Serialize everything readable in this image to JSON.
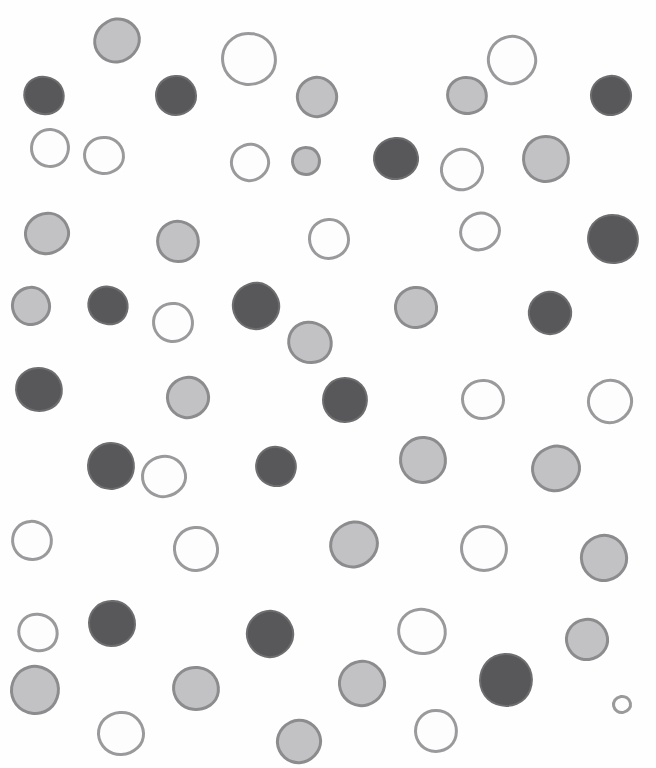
{
  "scene": {
    "description": "Hand-drawn watercolor circles pattern",
    "background": "#fefefe",
    "palette": {
      "dark": "#58585a",
      "light": "#c2c2c4",
      "outline": "#9a9a9c"
    },
    "circles": [
      {
        "x": 117,
        "y": 42,
        "d": 48,
        "t": "light"
      },
      {
        "x": 249,
        "y": 60,
        "d": 56,
        "t": "outline"
      },
      {
        "x": 512,
        "y": 60,
        "d": 50,
        "t": "outline"
      },
      {
        "x": 44,
        "y": 97,
        "d": 42,
        "t": "dark"
      },
      {
        "x": 176,
        "y": 96,
        "d": 42,
        "t": "dark"
      },
      {
        "x": 317,
        "y": 97,
        "d": 42,
        "t": "light"
      },
      {
        "x": 467,
        "y": 97,
        "d": 42,
        "t": "light"
      },
      {
        "x": 611,
        "y": 96,
        "d": 42,
        "t": "dark"
      },
      {
        "x": 50,
        "y": 148,
        "d": 40,
        "t": "outline"
      },
      {
        "x": 104,
        "y": 157,
        "d": 42,
        "t": "outline"
      },
      {
        "x": 250,
        "y": 163,
        "d": 40,
        "t": "outline"
      },
      {
        "x": 306,
        "y": 161,
        "d": 30,
        "t": "light"
      },
      {
        "x": 396,
        "y": 160,
        "d": 46,
        "t": "dark"
      },
      {
        "x": 462,
        "y": 170,
        "d": 44,
        "t": "outline"
      },
      {
        "x": 546,
        "y": 159,
        "d": 48,
        "t": "light"
      },
      {
        "x": 47,
        "y": 235,
        "d": 46,
        "t": "light"
      },
      {
        "x": 178,
        "y": 242,
        "d": 44,
        "t": "light"
      },
      {
        "x": 329,
        "y": 239,
        "d": 42,
        "t": "outline"
      },
      {
        "x": 480,
        "y": 233,
        "d": 42,
        "t": "outline"
      },
      {
        "x": 613,
        "y": 240,
        "d": 52,
        "t": "dark"
      },
      {
        "x": 31,
        "y": 306,
        "d": 40,
        "t": "light"
      },
      {
        "x": 108,
        "y": 307,
        "d": 42,
        "t": "dark"
      },
      {
        "x": 173,
        "y": 323,
        "d": 42,
        "t": "outline"
      },
      {
        "x": 256,
        "y": 306,
        "d": 48,
        "t": "dark"
      },
      {
        "x": 310,
        "y": 344,
        "d": 46,
        "t": "light"
      },
      {
        "x": 416,
        "y": 308,
        "d": 44,
        "t": "light"
      },
      {
        "x": 550,
        "y": 313,
        "d": 44,
        "t": "dark"
      },
      {
        "x": 39,
        "y": 391,
        "d": 48,
        "t": "dark"
      },
      {
        "x": 188,
        "y": 398,
        "d": 44,
        "t": "light"
      },
      {
        "x": 345,
        "y": 400,
        "d": 46,
        "t": "dark"
      },
      {
        "x": 483,
        "y": 401,
        "d": 44,
        "t": "outline"
      },
      {
        "x": 610,
        "y": 402,
        "d": 46,
        "t": "outline"
      },
      {
        "x": 111,
        "y": 466,
        "d": 48,
        "t": "dark"
      },
      {
        "x": 164,
        "y": 478,
        "d": 46,
        "t": "outline"
      },
      {
        "x": 276,
        "y": 467,
        "d": 42,
        "t": "dark"
      },
      {
        "x": 423,
        "y": 460,
        "d": 48,
        "t": "light"
      },
      {
        "x": 556,
        "y": 470,
        "d": 50,
        "t": "light"
      },
      {
        "x": 32,
        "y": 541,
        "d": 42,
        "t": "outline"
      },
      {
        "x": 196,
        "y": 549,
        "d": 46,
        "t": "outline"
      },
      {
        "x": 354,
        "y": 546,
        "d": 50,
        "t": "light"
      },
      {
        "x": 484,
        "y": 549,
        "d": 48,
        "t": "outline"
      },
      {
        "x": 604,
        "y": 558,
        "d": 48,
        "t": "light"
      },
      {
        "x": 38,
        "y": 634,
        "d": 42,
        "t": "outline"
      },
      {
        "x": 112,
        "y": 624,
        "d": 48,
        "t": "dark"
      },
      {
        "x": 270,
        "y": 634,
        "d": 48,
        "t": "dark"
      },
      {
        "x": 422,
        "y": 633,
        "d": 50,
        "t": "outline"
      },
      {
        "x": 587,
        "y": 640,
        "d": 44,
        "t": "light"
      },
      {
        "x": 35,
        "y": 690,
        "d": 50,
        "t": "light"
      },
      {
        "x": 196,
        "y": 690,
        "d": 48,
        "t": "light"
      },
      {
        "x": 362,
        "y": 684,
        "d": 48,
        "t": "light"
      },
      {
        "x": 506,
        "y": 680,
        "d": 54,
        "t": "dark"
      },
      {
        "x": 121,
        "y": 735,
        "d": 48,
        "t": "outline"
      },
      {
        "x": 299,
        "y": 742,
        "d": 46,
        "t": "light"
      },
      {
        "x": 436,
        "y": 731,
        "d": 44,
        "t": "outline"
      },
      {
        "x": 622,
        "y": 705,
        "d": 20,
        "t": "outline"
      }
    ]
  }
}
